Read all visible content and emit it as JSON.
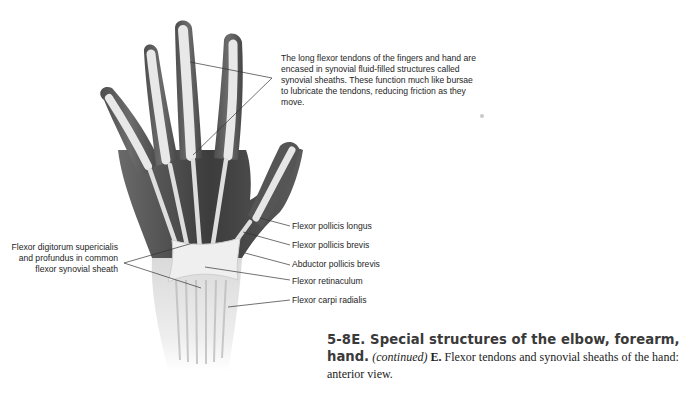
{
  "figure": {
    "callouts": {
      "top": "The long flexor tendons of the fingers and hand are encased in synovial fluid-filled structures called synovial sheaths. These function much like bursae to lubricate the tendons, reducing friction as they move.",
      "left": "Flexor digitorum supericialis and profundus in common flexor synovial sheath",
      "right": [
        {
          "label": "Flexor pollicis longus"
        },
        {
          "label": "Flexor pollicis brevis"
        },
        {
          "label": "Abductor pollicis brevis"
        },
        {
          "label": "Flexor retinaculum"
        },
        {
          "label": "Flexor carpi radialis"
        }
      ]
    },
    "caption": {
      "number_title": "5-8E. Special structures of the elbow, forearm, wrist, and",
      "title_end": "hand.",
      "continued": "(continued)",
      "panel": "E.",
      "description_line1": "Flexor tendons and synovial sheaths of the hand:",
      "description_line2": "anterior view."
    },
    "colors": {
      "skin_dark": "#5a5a5a",
      "muscle": "#4a4a4a",
      "tendon": "#e6e6e6",
      "leader_line": "#333333",
      "text": "#1e1e1e"
    }
  }
}
